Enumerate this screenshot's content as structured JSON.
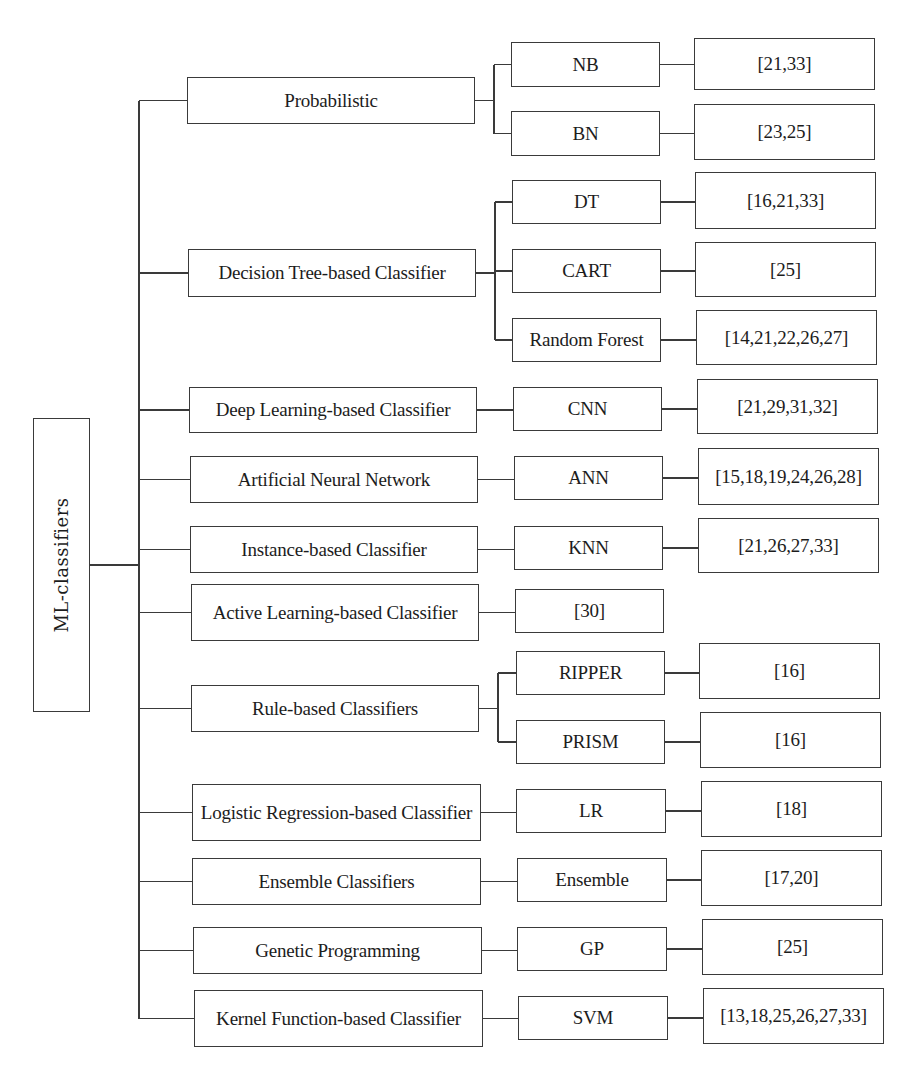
{
  "root": {
    "label": "ML-classifiers",
    "box": [
      33,
      418,
      57,
      294
    ]
  },
  "trunk_x": 139,
  "categories": [
    {
      "label": "Probabilistic",
      "box": [
        187,
        77,
        288,
        47
      ],
      "children": [
        {
          "label": "NB",
          "box": [
            511,
            42,
            149,
            45
          ],
          "refs": "[21,33]",
          "refs_box": [
            694,
            38,
            181,
            52
          ]
        },
        {
          "label": "BN",
          "box": [
            511,
            111,
            149,
            45
          ],
          "refs": "[23,25]",
          "refs_box": [
            694,
            104,
            181,
            56
          ]
        }
      ]
    },
    {
      "label": "Decision Tree-based Classifier",
      "box": [
        188,
        249,
        288,
        48
      ],
      "children": [
        {
          "label": "DT",
          "box": [
            512,
            180,
            149,
            44
          ],
          "refs": "[16,21,33]",
          "refs_box": [
            695,
            172,
            181,
            57
          ]
        },
        {
          "label": "CART",
          "box": [
            512,
            249,
            149,
            44
          ],
          "refs": "[25]",
          "refs_box": [
            695,
            242,
            181,
            55
          ]
        },
        {
          "label": "Random Forest",
          "box": [
            512,
            318,
            149,
            44
          ],
          "refs": "[14,21,22,26,27]",
          "refs_box": [
            696,
            310,
            181,
            55
          ]
        }
      ]
    },
    {
      "label": "Deep Learning-based Classifier",
      "box": [
        189,
        387,
        288,
        46
      ],
      "children": [
        {
          "label": "CNN",
          "box": [
            513,
            387,
            149,
            44
          ],
          "refs": "[21,29,31,32]",
          "refs_box": [
            697,
            379,
            181,
            55
          ]
        }
      ]
    },
    {
      "label": "Artificial Neural Network",
      "box": [
        190,
        456,
        288,
        47
      ],
      "children": [
        {
          "label": "ANN",
          "box": [
            514,
            456,
            149,
            44
          ],
          "refs": "[15,18,19,24,26,28]",
          "refs_box": [
            698,
            448,
            181,
            57
          ]
        }
      ]
    },
    {
      "label": "Instance-based Classifier",
      "box": [
        190,
        526,
        288,
        47
      ],
      "children": [
        {
          "label": "KNN",
          "box": [
            514,
            526,
            149,
            44
          ],
          "refs": "[21,26,27,33]",
          "refs_box": [
            698,
            518,
            181,
            55
          ]
        }
      ]
    },
    {
      "label": "Active Learning-based Classifier",
      "box": [
        191,
        584,
        288,
        57
      ],
      "children": [
        {
          "label": "[30]",
          "box": [
            515,
            589,
            149,
            44
          ]
        }
      ]
    },
    {
      "label": "Rule-based Classifiers",
      "box": [
        191,
        685,
        288,
        47
      ],
      "children": [
        {
          "label": "RIPPER",
          "box": [
            516,
            651,
            149,
            44
          ],
          "refs": "[16]",
          "refs_box": [
            699,
            643,
            181,
            56
          ]
        },
        {
          "label": "PRISM",
          "box": [
            516,
            720,
            149,
            44
          ],
          "refs": "[16]",
          "refs_box": [
            700,
            712,
            181,
            56
          ]
        }
      ]
    },
    {
      "label": "Logistic Regression-based Classifier",
      "box": [
        192,
        784,
        289,
        57
      ],
      "children": [
        {
          "label": "LR",
          "box": [
            516,
            789,
            150,
            44
          ],
          "refs": "[18]",
          "refs_box": [
            701,
            781,
            181,
            56
          ]
        }
      ]
    },
    {
      "label": "Ensemble Classifiers",
      "box": [
        192,
        858,
        289,
        47
      ],
      "children": [
        {
          "label": "Ensemble",
          "box": [
            517,
            858,
            150,
            44
          ],
          "refs": "[17,20]",
          "refs_box": [
            701,
            850,
            181,
            56
          ]
        }
      ]
    },
    {
      "label": "Genetic Programming",
      "box": [
        193,
        927,
        289,
        47
      ],
      "children": [
        {
          "label": "GP",
          "box": [
            517,
            927,
            150,
            44
          ],
          "refs": "[25]",
          "refs_box": [
            702,
            919,
            181,
            56
          ]
        }
      ]
    },
    {
      "label": "Kernel Function-based Classifier",
      "box": [
        194,
        990,
        289,
        57
      ],
      "children": [
        {
          "label": "SVM",
          "box": [
            518,
            996,
            150,
            44
          ],
          "refs": "[13,18,25,26,27,33]",
          "refs_box": [
            703,
            988,
            181,
            56
          ]
        }
      ]
    }
  ]
}
